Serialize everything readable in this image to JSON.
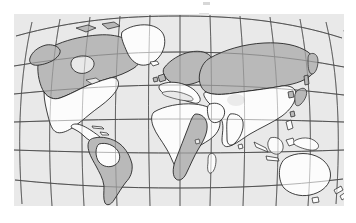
{
  "figure": {
    "kind": "world-map",
    "projection": "oval globe graticule (Winkel-tripel style)",
    "frame": {
      "x": 14,
      "y": 14,
      "width": 330,
      "height": 192
    }
  },
  "colors": {
    "ocean": "#e9e9e9",
    "land_unshaded": "#fcfcfc",
    "land_shaded": "#b9b9b9",
    "coastline": "#1d1d1d",
    "graticule": "#4a4a4a",
    "page_background": "#ffffff"
  },
  "legend": {
    "shaded_meaning": "shaded region",
    "unshaded_meaning": "unshaded region"
  },
  "graticule": {
    "parallels_count": 6,
    "meridians_count": 12,
    "visible_labels": []
  },
  "regions": [
    {
      "name": "north-america-north",
      "shading": "shaded"
    },
    {
      "name": "north-america-south",
      "shading": "unshaded"
    },
    {
      "name": "greenland",
      "shading": "unshaded"
    },
    {
      "name": "central-america",
      "shading": "unshaded"
    },
    {
      "name": "south-america",
      "shading": "shaded"
    },
    {
      "name": "amazon-basin",
      "shading": "unshaded"
    },
    {
      "name": "europe-north",
      "shading": "shaded"
    },
    {
      "name": "europe-south",
      "shading": "unshaded"
    },
    {
      "name": "siberia-northern-asia",
      "shading": "shaded"
    },
    {
      "name": "southern-asia",
      "shading": "unshaded"
    },
    {
      "name": "africa-north",
      "shading": "unshaded"
    },
    {
      "name": "africa-southeast",
      "shading": "shaded"
    },
    {
      "name": "madagascar",
      "shading": "unshaded"
    },
    {
      "name": "australia",
      "shading": "unshaded"
    },
    {
      "name": "new-zealand",
      "shading": "unshaded"
    },
    {
      "name": "japan",
      "shading": "shaded"
    },
    {
      "name": "indonesia",
      "shading": "unshaded"
    },
    {
      "name": "british-isles",
      "shading": "shaded"
    }
  ]
}
